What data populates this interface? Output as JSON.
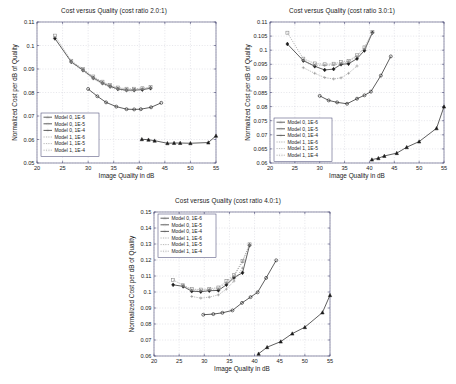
{
  "figure": {
    "background": "#ffffff",
    "axis_color": "#3a3a6a",
    "text_color": "#1a1a1a"
  },
  "common": {
    "xlabel": "Image Quality in dB",
    "ylabel": "Normalized Cost per dB of Quality",
    "xticks": [
      "20",
      "25",
      "30",
      "35",
      "40",
      "45",
      "50",
      "55"
    ],
    "legend_labels": [
      "Model 0, 1E-6",
      "Model 0, 1E-5",
      "Model 0, 1E-4",
      "Model 1, 1E-6",
      "Model 1, 1E-5",
      "Model 1, 1E-4"
    ],
    "series_colors": [
      "#1a1a1a",
      "#1a1a1a",
      "#1a1a1a",
      "#8a8a8a",
      "#8a8a8a",
      "#8a8a8a"
    ],
    "series_markers": [
      "triangle",
      "circle",
      "diamond",
      "plus",
      "plus",
      "square"
    ]
  },
  "chart_data": [
    {
      "type": "line",
      "title": "Cost versus Quality (cost ratio 2.0:1)",
      "xlabel": "Image Quality in dB",
      "ylabel": "Normalized Cost per dB of Quality",
      "xlim": [
        20,
        55
      ],
      "ylim": [
        0.05,
        0.11
      ],
      "xticks": [
        20,
        25,
        30,
        35,
        40,
        45,
        50,
        55
      ],
      "yticks": [
        0.05,
        0.06,
        0.07,
        0.08,
        0.09,
        0.1,
        0.11
      ],
      "grid": true,
      "legend_position": "lower left",
      "series": [
        {
          "name": "Model 0, 1E-6",
          "marker": "triangle",
          "color": "#1a1a1a",
          "style": "solid",
          "x": [
            40.5,
            41.8,
            43.0,
            45.5,
            46.8,
            48.0,
            50.0,
            53.5,
            55.0
          ],
          "y": [
            0.0601,
            0.0599,
            0.0595,
            0.0584,
            0.0585,
            0.0585,
            0.0584,
            0.0587,
            0.0616
          ]
        },
        {
          "name": "Model 0, 1E-5",
          "marker": "circle",
          "color": "#1a1a1a",
          "style": "solid",
          "x": [
            30.0,
            31.8,
            33.5,
            35.5,
            37.5,
            39.0,
            40.3,
            42.3,
            44.3
          ],
          "y": [
            0.0815,
            0.0784,
            0.0758,
            0.074,
            0.0729,
            0.0728,
            0.0729,
            0.0737,
            0.0756
          ]
        },
        {
          "name": "Model 0, 1E-4",
          "marker": "diamond",
          "color": "#1a1a1a",
          "style": "solid",
          "x": [
            23.5,
            26.7,
            29.0,
            31.0,
            32.8,
            34.3,
            35.8,
            37.5,
            39.0,
            40.6,
            42.2
          ],
          "y": [
            0.103,
            0.093,
            0.0895,
            0.0862,
            0.084,
            0.0826,
            0.0815,
            0.081,
            0.081,
            0.0812,
            0.0818
          ]
        },
        {
          "name": "Model 1, 1E-6",
          "marker": "plus",
          "color": "#8a8a8a",
          "style": "dotted",
          "x": [
            26.7,
            29.0,
            31.0,
            32.8,
            34.3,
            35.8,
            37.5,
            39.0
          ],
          "y": [
            0.0928,
            0.0892,
            0.0858,
            0.0836,
            0.0822,
            0.0812,
            0.0807,
            0.0807
          ]
        },
        {
          "name": "Model 1, 1E-5",
          "marker": "plus",
          "color": "#8a8a8a",
          "style": "dotted",
          "x": [
            26.7,
            29.0,
            31.0,
            32.8,
            34.3,
            35.8,
            37.5,
            39.0,
            40.6,
            42.2
          ],
          "y": [
            0.0932,
            0.0897,
            0.0864,
            0.0843,
            0.0829,
            0.0818,
            0.0813,
            0.0813,
            0.0815,
            0.082
          ]
        },
        {
          "name": "Model 1, 1E-4",
          "marker": "square",
          "color": "#8a8a8a",
          "style": "dotted",
          "x": [
            23.5,
            26.7,
            29.0,
            31.0,
            32.8,
            34.3,
            35.8,
            37.5,
            39.0,
            40.6,
            42.2
          ],
          "y": [
            0.1042,
            0.0935,
            0.09,
            0.0868,
            0.0846,
            0.0832,
            0.0821,
            0.0816,
            0.0816,
            0.0818,
            0.0823
          ]
        }
      ]
    },
    {
      "type": "line",
      "title": "Cost versus Quality (cost ratio 3.0:1)",
      "xlabel": "Image Quality in dB",
      "ylabel": "Normalized Cost per dB of Quality",
      "xlim": [
        20,
        55
      ],
      "ylim": [
        0.06,
        0.11
      ],
      "xticks": [
        20,
        25,
        30,
        35,
        40,
        45,
        50,
        55
      ],
      "yticks": [
        0.06,
        0.065,
        0.07,
        0.075,
        0.08,
        0.085,
        0.09,
        0.095,
        0.1,
        0.105,
        0.11
      ],
      "grid": true,
      "legend_position": "lower left",
      "series": [
        {
          "name": "Model 0, 1E-6",
          "marker": "triangle",
          "color": "#1a1a1a",
          "style": "solid",
          "x": [
            40.5,
            41.8,
            43.0,
            45.5,
            47.5,
            50.0,
            53.5,
            55.0
          ],
          "y": [
            0.0612,
            0.0617,
            0.0625,
            0.0635,
            0.0656,
            0.0676,
            0.0723,
            0.08
          ]
        },
        {
          "name": "Model 0, 1E-5",
          "marker": "circle",
          "color": "#1a1a1a",
          "style": "solid",
          "x": [
            30.0,
            31.8,
            33.5,
            35.5,
            37.5,
            39.0,
            40.3,
            42.3,
            44.3
          ],
          "y": [
            0.0838,
            0.0822,
            0.0815,
            0.081,
            0.0828,
            0.084,
            0.0853,
            0.091,
            0.0978
          ]
        },
        {
          "name": "Model 0, 1E-4",
          "marker": "diamond",
          "color": "#1a1a1a",
          "style": "solid",
          "x": [
            23.5,
            26.7,
            29.0,
            31.0,
            32.8,
            34.3,
            35.8,
            37.5,
            39.0,
            40.6
          ],
          "y": [
            0.1022,
            0.0963,
            0.0943,
            0.093,
            0.0933,
            0.095,
            0.0952,
            0.097,
            0.0999,
            0.1062
          ]
        },
        {
          "name": "Model 1, 1E-6",
          "marker": "plus",
          "color": "#8a8a8a",
          "style": "dotted",
          "x": [
            26.7,
            29.0,
            31.0,
            32.8,
            34.3,
            35.8,
            37.5
          ],
          "y": [
            0.0938,
            0.0918,
            0.0903,
            0.0898,
            0.0902,
            0.0918,
            0.0944
          ]
        },
        {
          "name": "Model 1, 1E-5",
          "marker": "plus",
          "color": "#8a8a8a",
          "style": "dotted",
          "x": [
            26.7,
            29.0,
            31.0,
            32.8,
            34.3,
            35.8,
            37.5,
            39.0,
            40.6
          ],
          "y": [
            0.0964,
            0.0947,
            0.0946,
            0.0948,
            0.0952,
            0.096,
            0.0978,
            0.1005,
            0.106
          ]
        },
        {
          "name": "Model 1, 1E-4",
          "marker": "square",
          "color": "#8a8a8a",
          "style": "dotted",
          "x": [
            23.5,
            26.7,
            29.0,
            31.0,
            32.8,
            34.3,
            35.8,
            37.5,
            39.0,
            40.6
          ],
          "y": [
            0.1062,
            0.097,
            0.0953,
            0.095,
            0.0952,
            0.0958,
            0.0962,
            0.0982,
            0.101,
            0.1065
          ]
        }
      ]
    },
    {
      "type": "line",
      "title": "Cost versus Quality (cost ratio 4.0:1)",
      "xlabel": "Image Quality in dB",
      "ylabel": "Normalized Cost per dB of Quality",
      "xlim": [
        20,
        55
      ],
      "ylim": [
        0.06,
        0.15
      ],
      "xticks": [
        20,
        25,
        30,
        35,
        40,
        45,
        50,
        55
      ],
      "yticks": [
        0.06,
        0.07,
        0.08,
        0.09,
        0.1,
        0.11,
        0.12,
        0.13,
        0.14,
        0.15
      ],
      "grid": true,
      "legend_position": "upper left",
      "series": [
        {
          "name": "Model 0, 1E-6",
          "marker": "triangle",
          "color": "#1a1a1a",
          "style": "solid",
          "x": [
            40.8,
            42.5,
            45.2,
            47.5,
            50.0,
            53.5,
            55.0
          ],
          "y": [
            0.0614,
            0.0655,
            0.069,
            0.074,
            0.078,
            0.0872,
            0.098
          ]
        },
        {
          "name": "Model 0, 1E-5",
          "marker": "circle",
          "color": "#1a1a1a",
          "style": "solid",
          "x": [
            29.8,
            31.8,
            33.6,
            35.6,
            37.5,
            39.2,
            40.6,
            42.3,
            44.3
          ],
          "y": [
            0.0858,
            0.0862,
            0.087,
            0.0885,
            0.0932,
            0.0968,
            0.0998,
            0.1088,
            0.1198
          ]
        },
        {
          "name": "Model 0, 1E-4",
          "marker": "diamond",
          "color": "#1a1a1a",
          "style": "solid",
          "x": [
            23.8,
            25.8,
            27.5,
            29.3,
            31.0,
            32.8,
            34.4,
            35.9,
            37.6,
            39.0
          ],
          "y": [
            0.1045,
            0.1035,
            0.1005,
            0.1002,
            0.1008,
            0.101,
            0.1045,
            0.109,
            0.112,
            0.1292
          ]
        },
        {
          "name": "Model 1, 1E-6",
          "marker": "plus",
          "color": "#8a8a8a",
          "style": "dotted",
          "x": [
            27.5,
            29.3,
            31.0,
            32.8,
            34.4,
            35.9,
            37.6
          ],
          "y": [
            0.0972,
            0.0962,
            0.0968,
            0.0982,
            0.1018,
            0.1068,
            0.115
          ]
        },
        {
          "name": "Model 1, 1E-5",
          "marker": "plus",
          "color": "#8a8a8a",
          "style": "dotted",
          "x": [
            25.8,
            27.5,
            29.3,
            31.0,
            32.8,
            34.4,
            35.9,
            37.6,
            39.0
          ],
          "y": [
            0.104,
            0.1012,
            0.101,
            0.1015,
            0.102,
            0.1058,
            0.1098,
            0.1188,
            0.1295
          ]
        },
        {
          "name": "Model 1, 1E-4",
          "marker": "square",
          "color": "#8a8a8a",
          "style": "dotted",
          "x": [
            23.8,
            25.8,
            27.5,
            29.3,
            31.0,
            32.8,
            34.4,
            35.9,
            37.6,
            39.0
          ],
          "y": [
            0.1075,
            0.1042,
            0.1018,
            0.1015,
            0.102,
            0.1028,
            0.1068,
            0.1105,
            0.1195,
            0.1298
          ]
        }
      ]
    }
  ]
}
